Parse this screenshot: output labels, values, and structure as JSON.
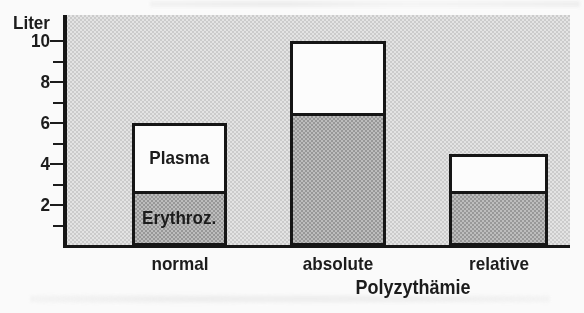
{
  "figure": {
    "colors": {
      "page_background": "#fafafa",
      "plot_halftone": "#d9d9d9",
      "erythrocyte_halftone": "#ababab",
      "plasma_fill": "#fcfcfc",
      "bar_border": "#161616",
      "text": "#1c1c1c"
    }
  },
  "chart_data": {
    "type": "bar",
    "stacked": true,
    "title": "",
    "ylabel": "Liter",
    "xlabel": "Polyzythämie",
    "categories": [
      "normal",
      "absolute",
      "relative"
    ],
    "series": [
      {
        "name": "Erythroz.",
        "values": [
          2.7,
          6.5,
          2.7
        ]
      },
      {
        "name": "Plasma",
        "values": [
          3.3,
          3.5,
          1.8
        ]
      }
    ],
    "totals": [
      6.0,
      10.0,
      4.5
    ],
    "y_axis": {
      "label": "Liter",
      "major_ticks": [
        10,
        8,
        6,
        4,
        2
      ],
      "minor_ticks": [
        9,
        7,
        5,
        3,
        1
      ],
      "range": [
        0,
        11.3
      ]
    },
    "grid": false,
    "legend_position": "labels-inside-first-bar"
  }
}
